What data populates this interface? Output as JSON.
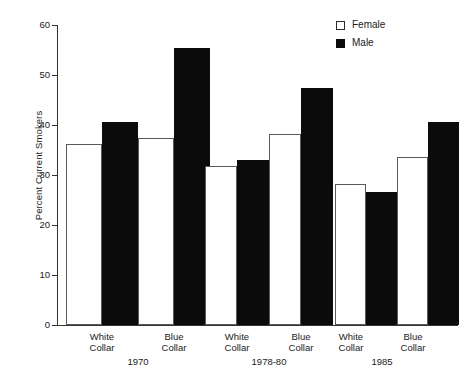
{
  "chart_data": {
    "type": "bar",
    "title": "",
    "xlabel": "",
    "ylabel": "Percent Current Smokers",
    "ylim": [
      0,
      60
    ],
    "yticks": [
      0,
      10,
      20,
      30,
      40,
      50,
      60
    ],
    "grid": false,
    "legend_position": "top-right",
    "groups": [
      "1970",
      "1978-80",
      "1985"
    ],
    "subgroups": [
      "White Collar",
      "Blue Collar"
    ],
    "categories": [
      "1970 White Collar",
      "1970 Blue Collar",
      "1978-80 White Collar",
      "1978-80 Blue Collar",
      "1985 White Collar",
      "1985 Blue Collar"
    ],
    "series": [
      {
        "name": "Female",
        "color": "#ffffff",
        "values": [
          36.2,
          37.5,
          31.8,
          38.2,
          28.2,
          33.6
        ]
      },
      {
        "name": "Male",
        "color": "#0b0b0b",
        "values": [
          40.6,
          55.4,
          33.0,
          47.4,
          26.6,
          40.6
        ]
      }
    ]
  },
  "top_partial_text": "",
  "axis": {
    "y_title": "Percent Current Smokers",
    "tick_labels": [
      "60",
      "50",
      "40",
      "30",
      "20",
      "10",
      "0"
    ]
  },
  "legend": {
    "items": [
      {
        "label": "Female",
        "swatch": "open-square-swatch"
      },
      {
        "label": "Male",
        "swatch": "filled-square-swatch"
      }
    ]
  },
  "x_axis": {
    "sub_labels": [
      {
        "line1": "White",
        "line2": "Collar"
      },
      {
        "line1": "Blue",
        "line2": "Collar"
      },
      {
        "line1": "White",
        "line2": "Collar"
      },
      {
        "line1": "Blue",
        "line2": "Collar"
      },
      {
        "line1": "White",
        "line2": "Collar"
      },
      {
        "line1": "Blue",
        "line2": "Collar"
      }
    ],
    "group_labels": [
      "1970",
      "1978-80",
      "1985"
    ]
  }
}
